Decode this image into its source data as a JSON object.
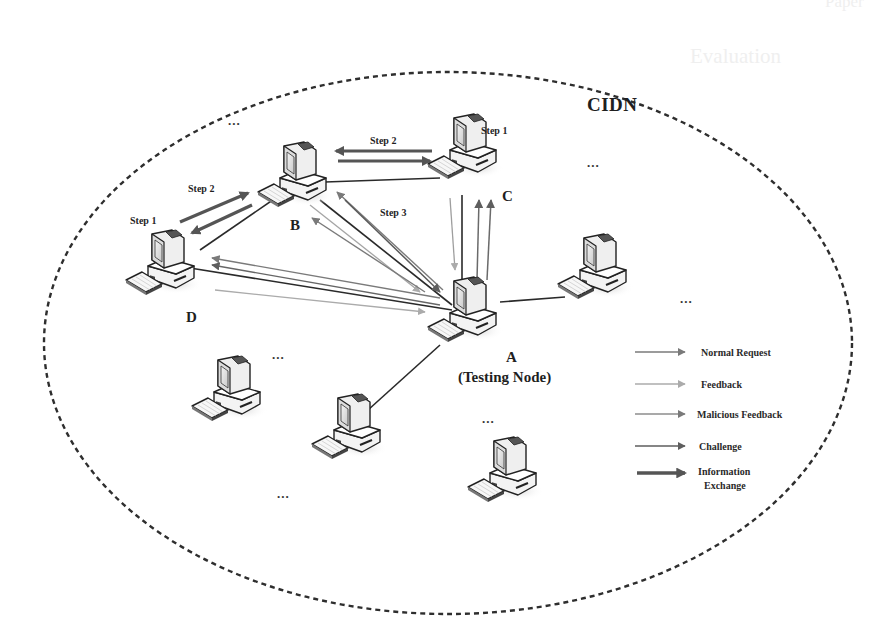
{
  "diagram": {
    "title": "CIDN",
    "boundary": "dashed-ellipse",
    "nodes": [
      {
        "id": "A",
        "label": "A",
        "sublabel": "(Testing Node)",
        "role": "testing-node"
      },
      {
        "id": "B",
        "label": "B"
      },
      {
        "id": "C",
        "label": "C"
      },
      {
        "id": "D",
        "label": "D"
      }
    ],
    "steps": [
      {
        "label": "Step 1",
        "near": "C"
      },
      {
        "label": "Step 2",
        "near": "B-C"
      },
      {
        "label": "Step 2",
        "near": "B-D"
      },
      {
        "label": "Step 1",
        "near": "D"
      },
      {
        "label": "Step 3",
        "near": "B-A"
      }
    ],
    "ellipsis": "...",
    "legend": [
      {
        "label": "Normal Request",
        "color": "#7a7a7a",
        "weight": "thin"
      },
      {
        "label": "Feedback",
        "color": "#aaaaaa",
        "weight": "thin"
      },
      {
        "label": "Malicious Feedback",
        "color": "#8c8c8c",
        "weight": "thin"
      },
      {
        "label": "Challenge",
        "color": "#5e5e5e",
        "weight": "thin"
      },
      {
        "label": "Information Exchange",
        "label_line1": "Information",
        "label_line2": "Exchange",
        "color": "#555555",
        "weight": "thick"
      }
    ]
  },
  "background_fragments": {
    "header_right": "Paper",
    "section_title": "Evaluation"
  }
}
